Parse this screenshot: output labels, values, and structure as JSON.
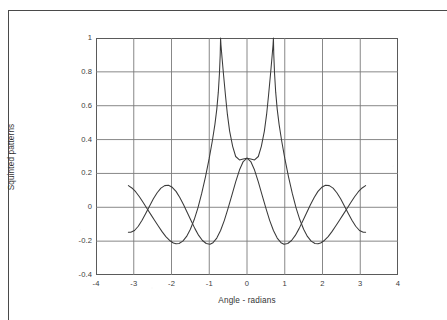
{
  "document": {
    "border_color": "#4a4a4a",
    "background": "#ffffff"
  },
  "chart_data": {
    "type": "line",
    "title": "",
    "xlabel": "Angle - radians",
    "ylabel": "Squinted patterns",
    "xlim": [
      -4,
      4
    ],
    "ylim": [
      -0.4,
      1
    ],
    "grid": true,
    "legend": null,
    "line_color": "#3a3a3a",
    "grid_color": "#7a7a7a",
    "frame_color": "#5a5a5a",
    "xticks": [
      -4,
      -3,
      -2,
      -1,
      0,
      1,
      2,
      3,
      4
    ],
    "xtick_labels": [
      "-4",
      "-3",
      "-2",
      "-1",
      "0",
      "1",
      "2",
      "3",
      "4"
    ],
    "yticks": [
      1,
      0.8,
      0.6,
      0.4,
      0.2,
      0,
      -0.2,
      -0.4
    ],
    "ytick_labels": [
      "1",
      "0.8",
      "0.6",
      "0.4",
      "0.2",
      "0",
      "-0.2",
      "-0.4"
    ],
    "x_domain_data": [
      -3.14159,
      3.14159
    ],
    "crossover": {
      "x": 0,
      "y": 0.29
    },
    "series": [
      {
        "name": "Squinted beam (left)",
        "peak_x": -0.7,
        "peak_y": 1.0,
        "points": [
          [
            -3.14159,
            0.128
          ],
          [
            -3.05,
            0.114
          ],
          [
            -2.95,
            0.092
          ],
          [
            -2.85,
            0.062
          ],
          [
            -2.75,
            0.028
          ],
          [
            -2.65,
            -0.007
          ],
          [
            -2.55,
            -0.042
          ],
          [
            -2.45,
            -0.077
          ],
          [
            -2.35,
            -0.111
          ],
          [
            -2.25,
            -0.144
          ],
          [
            -2.15,
            -0.173
          ],
          [
            -2.05,
            -0.196
          ],
          [
            -1.95,
            -0.211
          ],
          [
            -1.88,
            -0.216
          ],
          [
            -1.8,
            -0.214
          ],
          [
            -1.7,
            -0.2
          ],
          [
            -1.6,
            -0.172
          ],
          [
            -1.5,
            -0.13
          ],
          [
            -1.4,
            -0.074
          ],
          [
            -1.3,
            -0.003
          ],
          [
            -1.2,
            0.082
          ],
          [
            -1.1,
            0.18
          ],
          [
            -1.0,
            0.29
          ],
          [
            -0.92,
            0.39
          ],
          [
            -0.85,
            0.49
          ],
          [
            -0.8,
            0.58
          ],
          [
            -0.76,
            0.68
          ],
          [
            -0.73,
            0.79
          ],
          [
            -0.71,
            0.9
          ],
          [
            -0.7,
            1.0
          ],
          [
            -0.69,
            0.96
          ],
          [
            -0.66,
            0.88
          ],
          [
            -0.62,
            0.78
          ],
          [
            -0.57,
            0.66
          ],
          [
            -0.52,
            0.55
          ],
          [
            -0.46,
            0.45
          ],
          [
            -0.38,
            0.36
          ],
          [
            -0.3,
            0.3
          ],
          [
            -0.2,
            0.28
          ],
          [
            -0.1,
            0.285
          ],
          [
            0.0,
            0.29
          ],
          [
            0.1,
            0.27
          ],
          [
            0.2,
            0.22
          ],
          [
            0.3,
            0.15
          ],
          [
            0.4,
            0.072
          ],
          [
            0.5,
            -0.005
          ],
          [
            0.6,
            -0.077
          ],
          [
            0.7,
            -0.137
          ],
          [
            0.8,
            -0.182
          ],
          [
            0.9,
            -0.209
          ],
          [
            0.98,
            -0.218
          ],
          [
            1.08,
            -0.214
          ],
          [
            1.18,
            -0.196
          ],
          [
            1.28,
            -0.166
          ],
          [
            1.38,
            -0.126
          ],
          [
            1.48,
            -0.08
          ],
          [
            1.58,
            -0.032
          ],
          [
            1.68,
            0.015
          ],
          [
            1.78,
            0.058
          ],
          [
            1.88,
            0.094
          ],
          [
            1.98,
            0.118
          ],
          [
            2.08,
            0.13
          ],
          [
            2.18,
            0.128
          ],
          [
            2.28,
            0.113
          ],
          [
            2.38,
            0.086
          ],
          [
            2.48,
            0.05
          ],
          [
            2.58,
            0.008
          ],
          [
            2.68,
            -0.035
          ],
          [
            2.78,
            -0.077
          ],
          [
            2.88,
            -0.112
          ],
          [
            2.98,
            -0.137
          ],
          [
            3.08,
            -0.148
          ],
          [
            3.14159,
            -0.148
          ]
        ]
      },
      {
        "name": "Squinted beam (right)",
        "peak_x": 0.7,
        "peak_y": 1.0,
        "points": [
          [
            3.14159,
            0.128
          ],
          [
            3.05,
            0.114
          ],
          [
            2.95,
            0.092
          ],
          [
            2.85,
            0.062
          ],
          [
            2.75,
            0.028
          ],
          [
            2.65,
            -0.007
          ],
          [
            2.55,
            -0.042
          ],
          [
            2.45,
            -0.077
          ],
          [
            2.35,
            -0.111
          ],
          [
            2.25,
            -0.144
          ],
          [
            2.15,
            -0.173
          ],
          [
            2.05,
            -0.196
          ],
          [
            1.95,
            -0.211
          ],
          [
            1.88,
            -0.216
          ],
          [
            1.8,
            -0.214
          ],
          [
            1.7,
            -0.2
          ],
          [
            1.6,
            -0.172
          ],
          [
            1.5,
            -0.13
          ],
          [
            1.4,
            -0.074
          ],
          [
            1.3,
            -0.003
          ],
          [
            1.2,
            0.082
          ],
          [
            1.1,
            0.18
          ],
          [
            1.0,
            0.29
          ],
          [
            0.92,
            0.39
          ],
          [
            0.85,
            0.49
          ],
          [
            0.8,
            0.58
          ],
          [
            0.76,
            0.68
          ],
          [
            0.73,
            0.79
          ],
          [
            0.71,
            0.9
          ],
          [
            0.7,
            1.0
          ],
          [
            0.69,
            0.96
          ],
          [
            0.66,
            0.88
          ],
          [
            0.62,
            0.78
          ],
          [
            0.57,
            0.66
          ],
          [
            0.52,
            0.55
          ],
          [
            0.46,
            0.45
          ],
          [
            0.38,
            0.36
          ],
          [
            0.3,
            0.3
          ],
          [
            0.2,
            0.28
          ],
          [
            0.1,
            0.285
          ],
          [
            0.0,
            0.29
          ],
          [
            -0.1,
            0.27
          ],
          [
            -0.2,
            0.22
          ],
          [
            -0.3,
            0.15
          ],
          [
            -0.4,
            0.072
          ],
          [
            -0.5,
            -0.005
          ],
          [
            -0.6,
            -0.077
          ],
          [
            -0.7,
            -0.137
          ],
          [
            -0.8,
            -0.182
          ],
          [
            -0.9,
            -0.209
          ],
          [
            -0.98,
            -0.218
          ],
          [
            -1.08,
            -0.214
          ],
          [
            -1.18,
            -0.196
          ],
          [
            -1.28,
            -0.166
          ],
          [
            -1.38,
            -0.126
          ],
          [
            -1.48,
            -0.08
          ],
          [
            -1.58,
            -0.032
          ],
          [
            -1.68,
            0.015
          ],
          [
            -1.78,
            0.058
          ],
          [
            -1.88,
            0.094
          ],
          [
            -1.98,
            0.118
          ],
          [
            -2.08,
            0.13
          ],
          [
            -2.18,
            0.128
          ],
          [
            -2.28,
            0.113
          ],
          [
            -2.38,
            0.086
          ],
          [
            -2.48,
            0.05
          ],
          [
            -2.58,
            0.008
          ],
          [
            -2.68,
            -0.035
          ],
          [
            -2.78,
            -0.077
          ],
          [
            -2.88,
            -0.112
          ],
          [
            -2.98,
            -0.137
          ],
          [
            -3.08,
            -0.148
          ],
          [
            -3.14159,
            -0.148
          ]
        ]
      }
    ]
  }
}
